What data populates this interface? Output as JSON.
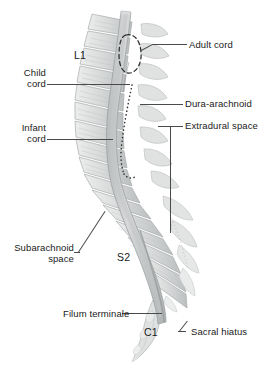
{
  "figure": {
    "background_color": "#ffffff",
    "ink_color": "#4a4a4a",
    "text_color": "#1a1a1a",
    "bone_fill": "#d9dbdb",
    "bone_shade": "#b4b7b8",
    "canal_fill": "#c9cccd"
  },
  "labels": {
    "adult_cord": "Adult cord",
    "child_cord_line1": "Child",
    "child_cord_line2": "cord",
    "infant_cord_line1": "Infant",
    "infant_cord_line2": "cord",
    "dura_arachnoid": "Dura-arachnoid",
    "extradural_space": "Extradural space",
    "subarachnoid_line1": "Subarachnoid",
    "subarachnoid_line2": "space",
    "filum_terminale": "Filum terminale",
    "sacral_hiatus": "Sacral hiatus"
  },
  "vertebral_levels": {
    "l1": "L1",
    "s2": "S2",
    "c1": "C1"
  }
}
